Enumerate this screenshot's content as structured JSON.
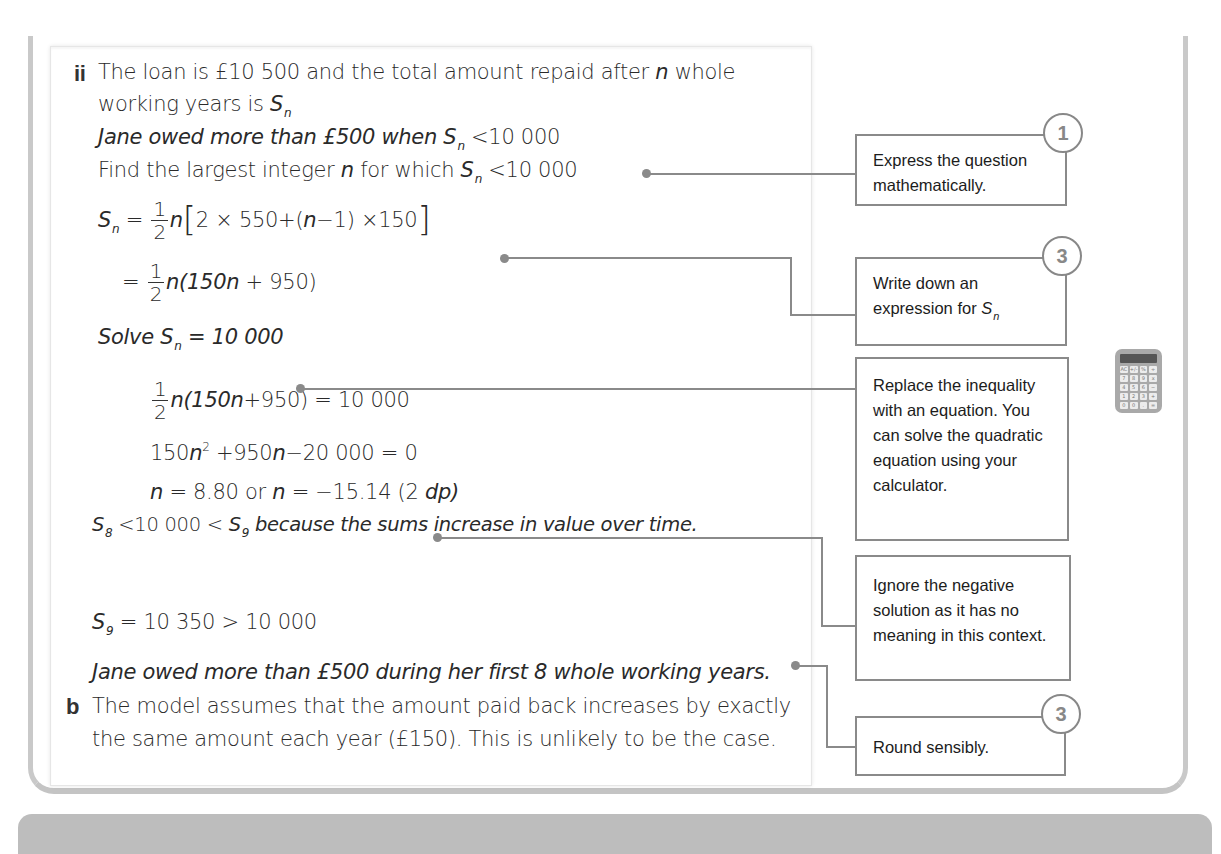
{
  "solution": {
    "part_ii_label": "ii",
    "part_b_label": "b",
    "lines": [
      {
        "id": "l1",
        "text_a": "The loan is ",
        "text_b": "£10 500",
        "text_c": " and the total amount repaid after ",
        "var": "n",
        "text_d": " whole"
      },
      {
        "id": "l2",
        "text_a": "working years is ",
        "sym": "S",
        "sub": "n"
      },
      {
        "id": "l3",
        "text_a": "Jane owed more than £500 when ",
        "sym": "S",
        "sub": "n",
        "text_b": " <10 000"
      },
      {
        "id": "l4",
        "text_a": "Find the largest integer ",
        "var": "n",
        "text_b": " for which ",
        "sym": "S",
        "sub": "n",
        "text_c": " <10 000"
      },
      {
        "id": "l5",
        "sym": "S",
        "sub": "n",
        "eq": " = ",
        "frac_num": "1",
        "frac_den": "2",
        "text_a": "n",
        "bracket_open": "[",
        "text_b": "2 × 550+(",
        "var": "n",
        "text_c": "−1) ×150",
        "bracket_close": "]"
      },
      {
        "id": "l6",
        "eq": "= ",
        "frac_num": "1",
        "frac_den": "2",
        "text_a": "n(150",
        "var": "n",
        "text_b": " + 950)"
      },
      {
        "id": "l7",
        "text_a": "Solve ",
        "sym": "S",
        "sub": "n",
        "text_b": " = 10 000"
      },
      {
        "id": "l8",
        "frac_num": "1",
        "frac_den": "2",
        "text_a": "n(150",
        "var": "n",
        "text_b": "+950) = 10 000"
      },
      {
        "id": "l9",
        "text_a": "150",
        "var": "n",
        "sup": "2",
        "text_b": " +950",
        "var2": "n",
        "text_c": "−20 000 = 0"
      },
      {
        "id": "l10",
        "var": "n",
        "text_a": " = 8.80 or ",
        "var2": "n",
        "text_b": " = −15.14  (2 ",
        "text_c": "dp)"
      },
      {
        "id": "l11",
        "sym": "S",
        "sub": "8",
        "text_a": " <10 000 < ",
        "sym2": "S",
        "sub2": "9",
        "text_b": " because the sums increase in value over time."
      },
      {
        "id": "l12",
        "sym": "S",
        "sub": "9",
        "text_a": " = 10 350 > 10 000"
      },
      {
        "id": "l13",
        "text_a": "Jane owed more than £500 during her first 8 whole working years."
      },
      {
        "id": "l14",
        "text_a": "The model assumes that the amount paid back increases by exactly"
      },
      {
        "id": "l15",
        "text_a": "the same amount each year (£150). This is unlikely to be the case."
      }
    ]
  },
  "callouts": [
    {
      "id": "c1",
      "step": "1",
      "text": "Express the question mathematically."
    },
    {
      "id": "c2",
      "step": "3",
      "text_a": "Write down an expression for ",
      "sym": "S",
      "sub": "n"
    },
    {
      "id": "c3",
      "step": "",
      "text": "Replace the inequality with an equation. You can solve the quadratic equation using your calculator.",
      "icon": "calculator-icon"
    },
    {
      "id": "c4",
      "step": "",
      "text": "Ignore the negative solution as it has no meaning in this context."
    },
    {
      "id": "c5",
      "step": "3",
      "text": "Round sensibly."
    }
  ],
  "calculator_keys": [
    "AC",
    "+/-",
    "%",
    "÷",
    "7",
    "8",
    "9",
    "x",
    "4",
    "5",
    "6",
    "−",
    "1",
    "2",
    "3",
    "+",
    "0",
    "0",
    ".",
    "="
  ],
  "colors": {
    "frame": "#c9c9c9",
    "callout_border": "#8a8a8a",
    "step_circle": "#888888",
    "bottom_bar": "#bdbdbd"
  }
}
